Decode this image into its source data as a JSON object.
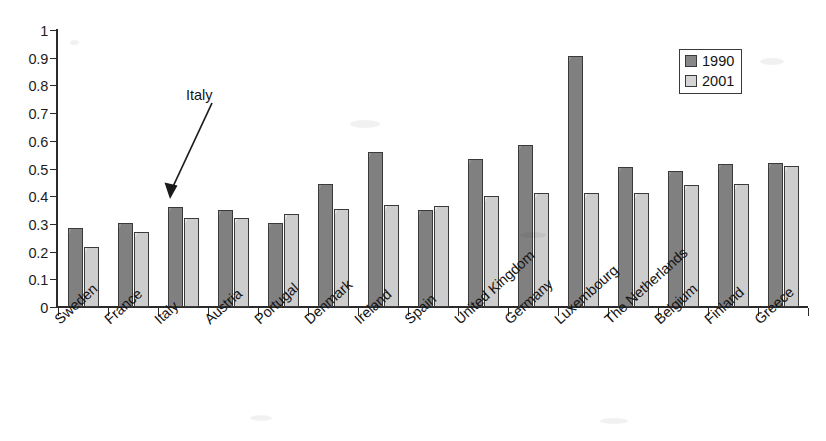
{
  "chart_data": {
    "type": "bar",
    "title": "",
    "subtitle": "",
    "xlabel": "",
    "ylabel": "",
    "ylim": [
      0,
      1
    ],
    "yticks": [
      "0",
      "0.1",
      "0.2",
      "0.3",
      "0.4",
      "0.5",
      "0.6",
      "0.7",
      "0.8",
      "0.9",
      "1"
    ],
    "grid": false,
    "legend_position": "top-right",
    "categories": [
      "Sweden",
      "France",
      "Italy",
      "Austria",
      "Portugal",
      "Denmark",
      "Ireland",
      "Spain",
      "United Kingdom",
      "Germany",
      "Luxembourg",
      "The Netherlands",
      "Belgium",
      "Finland",
      "Greece"
    ],
    "series": [
      {
        "name": "1990",
        "color": "#878787",
        "values": [
          0.285,
          0.305,
          0.36,
          0.35,
          0.305,
          0.445,
          0.56,
          0.35,
          0.535,
          0.585,
          0.905,
          0.505,
          0.49,
          0.515,
          0.52
        ]
      },
      {
        "name": "2001",
        "color": "#d4d4d4",
        "values": [
          0.215,
          0.27,
          0.32,
          0.32,
          0.335,
          0.355,
          0.37,
          0.365,
          0.4,
          0.41,
          0.41,
          0.41,
          0.44,
          0.445,
          0.51
        ]
      }
    ],
    "annotations": [
      {
        "text": "Italy",
        "target_category": "Italy",
        "target_series": "1990"
      }
    ]
  },
  "legend": {
    "entries": [
      {
        "label": "1990",
        "swatch": "legend-swatch-1990"
      },
      {
        "label": "2001",
        "swatch": "legend-swatch-2001"
      }
    ]
  }
}
